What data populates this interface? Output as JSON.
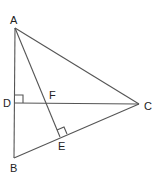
{
  "diagram": {
    "type": "triangle-with-altitudes",
    "points": {
      "A": {
        "label": "A",
        "x": 15,
        "y": 28,
        "lx": 10,
        "ly": 24
      },
      "B": {
        "label": "B",
        "x": 14,
        "y": 158,
        "lx": 10,
        "ly": 172
      },
      "C": {
        "label": "C",
        "x": 139,
        "y": 104,
        "lx": 144,
        "ly": 110
      },
      "D": {
        "label": "D",
        "x": 15,
        "y": 103,
        "lx": 3,
        "ly": 107
      },
      "E": {
        "label": "E",
        "x": 60,
        "y": 137,
        "lx": 58,
        "ly": 150
      },
      "F": {
        "label": "F",
        "x": 45,
        "y": 103,
        "lx": 49,
        "ly": 99
      }
    },
    "segments": [
      "AB",
      "AC",
      "BC",
      "DC",
      "AE"
    ],
    "right_angles": [
      "ADC",
      "AEC"
    ]
  }
}
